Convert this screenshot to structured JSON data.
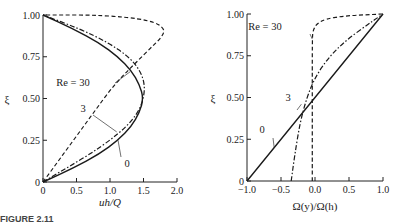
{
  "chart_data": [
    {
      "type": "line",
      "title": "",
      "xlabel": "uh/Q",
      "ylabel": "ξ",
      "xlim": [
        0,
        2.0
      ],
      "ylim": [
        0,
        1.0
      ],
      "xticks": [
        "0",
        "0.5",
        "1.0",
        "1.5",
        "2.0"
      ],
      "yticks": [
        "0",
        "0.25",
        "0.50",
        "0.75",
        "1.00"
      ],
      "grid": false,
      "legend": "inline curve labels",
      "series": [
        {
          "name": "Re = 0",
          "label": "0",
          "style": "solid",
          "x": [
            0,
            0.45,
            0.84,
            1.12,
            1.32,
            1.44,
            1.5,
            1.44,
            1.32,
            1.12,
            0.84,
            0.45,
            0
          ],
          "y": [
            0,
            0.083,
            0.167,
            0.25,
            0.333,
            0.417,
            0.5,
            0.583,
            0.667,
            0.75,
            0.833,
            0.917,
            1.0
          ]
        },
        {
          "name": "Re = 3",
          "label": "3",
          "style": "dash-dot",
          "x": [
            0,
            0.35,
            0.7,
            1.0,
            1.25,
            1.42,
            1.5,
            1.52,
            1.45,
            1.28,
            0.98,
            0.55,
            0
          ],
          "y": [
            0,
            0.083,
            0.167,
            0.25,
            0.333,
            0.417,
            0.5,
            0.583,
            0.667,
            0.75,
            0.833,
            0.917,
            1.0
          ]
        },
        {
          "name": "Re = 30",
          "label": "Re = 30",
          "style": "dashed",
          "x": [
            0,
            0.2,
            0.4,
            0.6,
            0.8,
            1.0,
            1.2,
            1.4,
            1.6,
            1.78,
            1.82,
            1.6,
            0.9,
            0
          ],
          "y": [
            0,
            0.11,
            0.22,
            0.33,
            0.44,
            0.55,
            0.64,
            0.72,
            0.8,
            0.87,
            0.92,
            0.97,
            1.0,
            1.0
          ]
        }
      ]
    },
    {
      "type": "line",
      "title": "",
      "xlabel": "Ω(y)/Ω(h)",
      "ylabel": "ξ",
      "xlim": [
        -1.0,
        1.0
      ],
      "ylim": [
        0,
        1.0
      ],
      "xticks": [
        "−1.0",
        "−0.5",
        "0.0",
        "0.5",
        "1.0"
      ],
      "yticks": [
        "0",
        "0.25",
        "0.50",
        "0.75",
        "1.00"
      ],
      "grid": false,
      "legend": "inline curve labels",
      "series": [
        {
          "name": "Re = 0",
          "label": "0",
          "style": "solid",
          "x": [
            -1.0,
            1.0
          ],
          "y": [
            0,
            1.0
          ]
        },
        {
          "name": "Re = 3",
          "label": "3",
          "style": "dash-dot",
          "x": [
            -0.35,
            -0.3,
            -0.22,
            -0.12,
            0.0,
            0.2,
            0.45,
            0.75,
            1.0
          ],
          "y": [
            0,
            0.15,
            0.35,
            0.5,
            0.62,
            0.74,
            0.84,
            0.93,
            1.0
          ]
        },
        {
          "name": "Re = 30",
          "label": "Re = 30",
          "style": "dashed",
          "x": [
            -0.04,
            -0.04,
            -0.04,
            -0.03,
            0.02,
            0.15,
            0.45,
            1.0
          ],
          "y": [
            0,
            0.5,
            0.85,
            0.9,
            0.94,
            0.97,
            0.99,
            1.0
          ]
        }
      ]
    }
  ],
  "caption": "FIGURE 2.11"
}
